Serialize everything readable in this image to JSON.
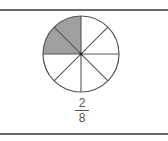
{
  "diagram": {
    "type": "fraction-circle",
    "total_parts": 8,
    "shaded_parts": 2,
    "shaded_color": "#a0a0a0",
    "line_color": "#555555",
    "fraction": {
      "numerator": "2",
      "denominator": "8"
    }
  }
}
